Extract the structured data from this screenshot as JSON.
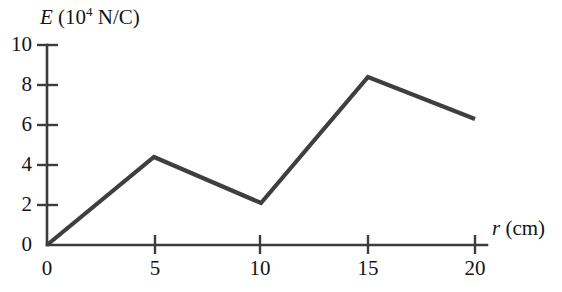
{
  "chart_data": {
    "type": "line",
    "title": "",
    "subtitle": "",
    "xlabel": "r (cm)",
    "xlabel_variable": "r",
    "xlabel_units": "(cm)",
    "ylabel": "E (10^4 N/C)",
    "ylabel_variable": "E",
    "ylabel_units": "(10",
    "ylabel_exponent": "4",
    "ylabel_units_tail": " N/C)",
    "xlim": [
      0,
      20
    ],
    "ylim": [
      0,
      10
    ],
    "xticks": [
      0,
      5,
      10,
      15,
      20
    ],
    "yticks": [
      0,
      2,
      4,
      6,
      8,
      10
    ],
    "xtick_labels": [
      "0",
      "5",
      "10",
      "15",
      "20"
    ],
    "ytick_labels": [
      "0",
      "2",
      "4",
      "6",
      "8",
      "10"
    ],
    "grid": false,
    "legend": false,
    "legend_position": "none",
    "line_color": "#3f3f3f",
    "axis_color": "#3c3c3c",
    "background_color": "#ffffff",
    "series": [
      {
        "name": "E(r)",
        "x": [
          0,
          5,
          10,
          15,
          20
        ],
        "values": [
          0,
          4.4,
          2.1,
          8.4,
          6.3
        ]
      }
    ]
  },
  "axes": {
    "y_title_prefix": "E",
    "y_title_open": " (10",
    "y_title_exp": "4",
    "y_title_rest": " N/C)",
    "x_title_prefix": "r",
    "x_title_rest": " (cm)"
  }
}
